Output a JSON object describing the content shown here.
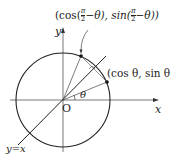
{
  "diagram": {
    "type": "unit-circle-reflection",
    "labels": {
      "top_point": "(cos(π/2−θ), sin(π/2−θ))",
      "top_point_parts": {
        "open": "(cos(",
        "frac_num": "π",
        "frac_den": "2",
        "mid": "−θ), sin(",
        "close": "−θ))"
      },
      "right_point": "(cos θ, sin θ)",
      "origin": "O",
      "x_axis": "x",
      "y_axis": "y",
      "angle": "θ",
      "line": "y=x"
    },
    "colors": {
      "stroke": "#222222",
      "background": "#ffffff"
    }
  }
}
